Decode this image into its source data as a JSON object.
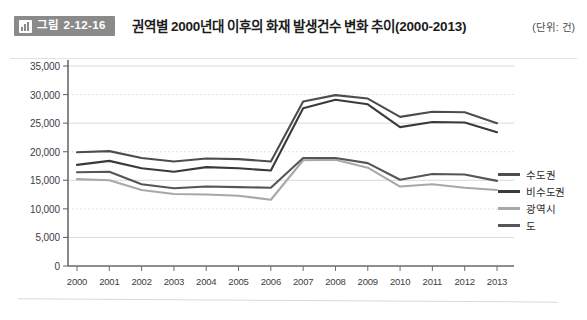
{
  "header": {
    "badge_icon": "bar-chart-icon",
    "badge_label": "그림 2-12-16",
    "title": "권역별 2000년대 이후의 화재 발생건수 변화 추이(2000-2013)",
    "unit": "(단위: 건)"
  },
  "colors": {
    "series_sudogwon": "#4d4d4d",
    "series_bisudogwon": "#3a3a3a",
    "series_gwangyeoksi": "#a8a8a8",
    "series_do": "#555555",
    "axis": "#6b6b6b",
    "grid": "#cfcfcf",
    "badge_bg": "#8a8a8a"
  },
  "chart_data": {
    "type": "line",
    "title": "권역별 2000년대 이후의 화재 발생건수 변화 추이(2000-2013)",
    "xlabel": "",
    "ylabel": "",
    "unit": "건",
    "grid": true,
    "legend_position": "right",
    "ylim": [
      0,
      35000
    ],
    "ytick_step": 5000,
    "yticks": [
      "0",
      "5,000",
      "10,000",
      "15,000",
      "20,000",
      "25,000",
      "30,000",
      "35,000"
    ],
    "ytick_values": [
      0,
      5000,
      10000,
      15000,
      20000,
      25000,
      30000,
      35000
    ],
    "categories": [
      "2000",
      "2001",
      "2002",
      "2003",
      "2004",
      "2005",
      "2006",
      "2007",
      "2008",
      "2009",
      "2010",
      "2011",
      "2012",
      "2013"
    ],
    "series": [
      {
        "name": "수도권",
        "color": "#4d4d4d",
        "values": [
          19900,
          20100,
          18900,
          18300,
          18800,
          18700,
          18300,
          28800,
          29900,
          29300,
          26100,
          27000,
          26900,
          25000
        ]
      },
      {
        "name": "비수도권",
        "color": "#3a3a3a",
        "values": [
          17700,
          18400,
          17100,
          16500,
          17300,
          17100,
          16700,
          27600,
          29100,
          28300,
          24300,
          25200,
          25100,
          23400
        ]
      },
      {
        "name": "광역시",
        "color": "#a8a8a8",
        "values": [
          15200,
          15000,
          13300,
          12600,
          12500,
          12300,
          11600,
          18500,
          18600,
          17200,
          13900,
          14300,
          13700,
          13300
        ]
      },
      {
        "name": "도",
        "color": "#555555",
        "values": [
          16400,
          16500,
          14300,
          13600,
          13900,
          13800,
          13700,
          18900,
          18900,
          18000,
          15100,
          16100,
          16000,
          14900
        ]
      }
    ]
  }
}
